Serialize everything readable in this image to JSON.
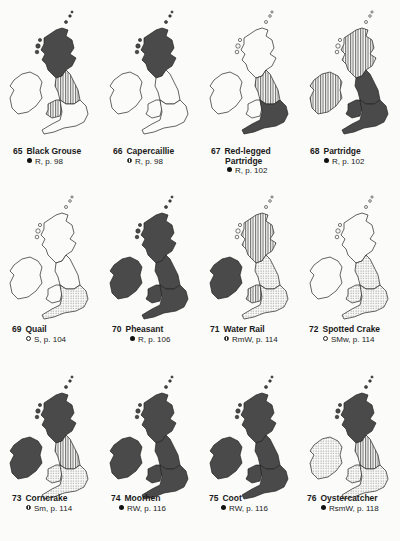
{
  "page": {
    "type": "bird distribution maps page",
    "colors": {
      "dark_fill": "#4a4a4a",
      "outline": "#222222",
      "paper": "#fbfbf9",
      "hatch": "#555555"
    }
  },
  "maps": [
    {
      "number": "65",
      "name": "Black Grouse",
      "name2": "",
      "symbol": "filled",
      "status": "R, p. 98",
      "regions": {
        "scotland": "dark",
        "n_england": "vstripe",
        "wales": "vstripe",
        "ireland": "none",
        "s_england": "none"
      }
    },
    {
      "number": "66",
      "name": "Capercaillie",
      "name2": "",
      "symbol": "half",
      "status": "R, p. 98",
      "regions": {
        "scotland": "dark",
        "n_england": "none",
        "wales": "none",
        "ireland": "none",
        "s_england": "none"
      }
    },
    {
      "number": "67",
      "name": "Red-legged",
      "name2": "Partridge",
      "symbol": "filled",
      "status": "R, p. 102",
      "regions": {
        "scotland": "none",
        "n_england": "vstripe",
        "wales": "none",
        "ireland": "none",
        "s_england": "dark"
      }
    },
    {
      "number": "68",
      "name": "Partridge",
      "name2": "",
      "symbol": "filled",
      "status": "R, p. 102",
      "regions": {
        "scotland": "vstripe",
        "n_england": "dark",
        "wales": "dark",
        "ireland": "vstripe",
        "s_england": "dark"
      }
    },
    {
      "number": "69",
      "name": "Quail",
      "name2": "",
      "symbol": "open",
      "status": "S, p. 104",
      "regions": {
        "scotland": "none",
        "n_england": "none",
        "wales": "none",
        "ireland": "none",
        "s_england": "dots"
      }
    },
    {
      "number": "70",
      "name": "Pheasant",
      "name2": "",
      "symbol": "filled",
      "status": "R, p. 106",
      "regions": {
        "scotland": "dark",
        "n_england": "dark",
        "wales": "dark",
        "ireland": "dark",
        "s_england": "dark"
      }
    },
    {
      "number": "71",
      "name": "Water Rail",
      "name2": "",
      "symbol": "half",
      "status": "RmW, p. 114",
      "regions": {
        "scotland": "vstripe",
        "n_england": "dots",
        "wales": "vstripe",
        "ireland": "dark",
        "s_england": "dots"
      }
    },
    {
      "number": "72",
      "name": "Spotted Crake",
      "name2": "",
      "symbol": "open",
      "status": "SMw, p. 114",
      "regions": {
        "scotland": "none",
        "n_england": "dots",
        "wales": "dots",
        "ireland": "none",
        "s_england": "dots"
      }
    },
    {
      "number": "73",
      "name": "Corncrake",
      "name2": "",
      "symbol": "half",
      "status": "Sm, p. 114",
      "regions": {
        "scotland": "dark",
        "n_england": "vstripe",
        "wales": "dots",
        "ireland": "dark",
        "s_england": "dots"
      }
    },
    {
      "number": "74",
      "name": "Moorhen",
      "name2": "",
      "symbol": "filled",
      "status": "RW, p. 116",
      "regions": {
        "scotland": "dark",
        "n_england": "dark",
        "wales": "dark",
        "ireland": "dark",
        "s_england": "dark"
      }
    },
    {
      "number": "75",
      "name": "Coot",
      "name2": "",
      "symbol": "filled",
      "status": "RW, p. 116",
      "regions": {
        "scotland": "dark",
        "n_england": "dark",
        "wales": "dark",
        "ireland": "dark",
        "s_england": "dark"
      }
    },
    {
      "number": "76",
      "name": "Oystercatcher",
      "name2": "",
      "symbol": "filled",
      "status": "RsmW, p. 118",
      "regions": {
        "scotland": "dark",
        "n_england": "vstripe",
        "wales": "dots",
        "ireland": "dots",
        "s_england": "dots"
      }
    }
  ]
}
